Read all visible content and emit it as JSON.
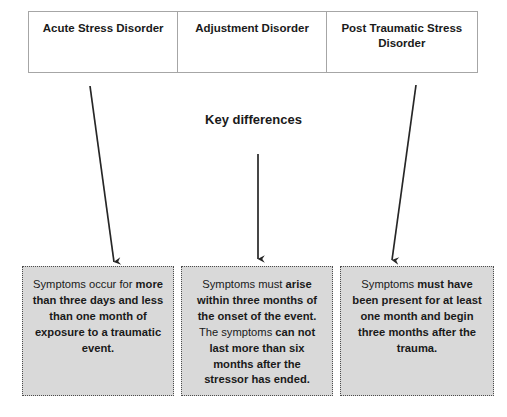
{
  "diagram": {
    "title_text": "Key differences",
    "columns": [
      {
        "header": "Acute Stress Disorder"
      },
      {
        "header": "Adjustment Disorder"
      },
      {
        "header": "Post Traumatic Stress Disorder"
      }
    ],
    "details": [
      {
        "plain_prefix": "Symptoms occur for ",
        "bold_text": "more than three days and less than one month of exposure to a traumatic event.",
        "full_text": "Symptoms occur for more than three days and less than one month of exposure to a traumatic event."
      },
      {
        "plain_prefix": "Symptoms must ",
        "bold_text": "arise within three months of the onset of the event.",
        "plain_middle": " The symptoms ",
        "bold_text_2": "can not last more than six months after the stressor has ended.",
        "full_text": "Symptoms must arise within three months of the onset of the event. The symptoms can not last more than six months after the stressor has ended."
      },
      {
        "plain_prefix": "Symptoms ",
        "bold_text": "must have been present for at least one month and begin three months after the trauma.",
        "full_text": "Symptoms must have been present for at least one month and begin three months after the trauma."
      }
    ],
    "arrows": [
      {
        "name": "arrow-acute-stress",
        "x1": 90,
        "y1": 86,
        "x2": 114,
        "y2": 262
      },
      {
        "name": "arrow-adjustment",
        "x1": 258,
        "y1": 154,
        "x2": 258,
        "y2": 259
      },
      {
        "name": "arrow-ptsd",
        "x1": 416,
        "y1": 85,
        "x2": 392,
        "y2": 260
      }
    ],
    "colors": {
      "box_fill": "#d9d9d9",
      "box_border": "#4d4d4d",
      "table_border": "#a6a6a6",
      "text": "#1a1a1a",
      "arrow": "#262626",
      "page_background": "#ffffff"
    }
  }
}
